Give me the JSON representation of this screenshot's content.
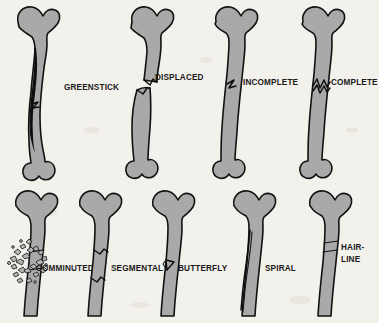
{
  "figure": {
    "background_color": "#f3f1ec",
    "bone_fill_color": "#a9a9a9",
    "outline_color": "#111111",
    "label_color": "#1a1a1a"
  },
  "labels": {
    "greenstick": "GREENSTICK",
    "displaced": "DISPLACED",
    "incomplete": "INCOMPLETE",
    "complete": "COMPLETE",
    "comminuted": "COMMINUTED",
    "segmental": "SEGMENTAL",
    "butterfly": "BUTTERFLY",
    "spiral": "SPIRAL",
    "hairline_line1": "HAIR-",
    "hairline_line2": "LINE"
  },
  "specimens": [
    {
      "id": "greenstick",
      "label": "GREENSTICK",
      "row": 1,
      "column": 1,
      "bone_view": "full-femur",
      "fracture_pattern": "long curved split running lengthwise along the shaft, bone bent but not separated"
    },
    {
      "id": "displaced",
      "label": "DISPLACED",
      "row": 1,
      "column": 2,
      "bone_view": "full-femur",
      "fracture_pattern": "transverse break with the two fragments offset sideways and out of alignment"
    },
    {
      "id": "incomplete",
      "label": "INCOMPLETE",
      "row": 1,
      "column": 3,
      "bone_view": "full-femur",
      "fracture_pattern": "short crack entering from one cortex only, not crossing the full width"
    },
    {
      "id": "complete",
      "label": "COMPLETE",
      "row": 1,
      "column": 4,
      "bone_view": "full-femur",
      "fracture_pattern": "jagged zigzag break crossing the entire width of the shaft"
    },
    {
      "id": "comminuted",
      "label": "COMMINUTED",
      "row": 2,
      "column": 1,
      "bone_view": "proximal-femur",
      "fracture_pattern": "shaft shattered into many small scattered bone fragments"
    },
    {
      "id": "segmental",
      "label": "SEGMENTAL",
      "row": 2,
      "column": 2,
      "bone_view": "proximal-femur",
      "fracture_pattern": "two separate transverse breaks isolating a free middle segment"
    },
    {
      "id": "butterfly",
      "label": "BUTTERFLY",
      "row": 2,
      "column": 3,
      "bone_view": "proximal-femur",
      "fracture_pattern": "triangular wedge-shaped fragment detached from the side of the shaft"
    },
    {
      "id": "spiral",
      "label": "SPIRAL",
      "row": 2,
      "column": 4,
      "bone_view": "proximal-femur",
      "fracture_pattern": "long oblique break winding diagonally down around the shaft"
    },
    {
      "id": "hairline",
      "label": "HAIR-LINE",
      "row": 2,
      "column": 5,
      "bone_view": "proximal-femur",
      "fracture_pattern": "very thin transverse crack with no displacement of the bone"
    }
  ]
}
